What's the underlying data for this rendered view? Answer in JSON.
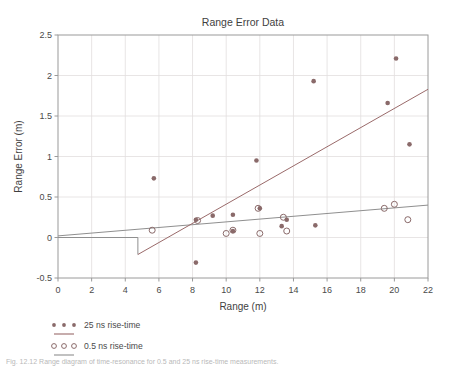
{
  "figure": {
    "caption": "Fig. 12.12  Range diagram of time-resonance for 0.5 and 25 ns rise-time measurements."
  },
  "chart_data": {
    "type": "scatter",
    "title": "Range Error Data",
    "xlabel": "Range (m)",
    "ylabel": "Range Error (m)",
    "xlim": [
      0,
      22
    ],
    "ylim": [
      -0.5,
      2.5
    ],
    "xticks": [
      0,
      2,
      4,
      6,
      8,
      10,
      12,
      14,
      16,
      18,
      20,
      22
    ],
    "yticks": [
      -0.5,
      0,
      0.5,
      1,
      1.5,
      2,
      2.5
    ],
    "xtick_labels": [
      "0",
      "2",
      "4",
      "6",
      "8",
      "10",
      "12",
      "14",
      "16",
      "18",
      "20",
      "22"
    ],
    "ytick_labels": [
      "-0.5",
      "0",
      "0.5",
      "1",
      "1.5",
      "2",
      "2.5"
    ],
    "grid": true,
    "legend_position": "below-left",
    "marker_color": "#8a6a6a",
    "line_color_25ns": "#9a6a6a",
    "line_color_05ns": "#8f8f8f",
    "axis_color": "#9a9a9a",
    "grid_color": "#e2dede",
    "series": [
      {
        "name": "25 ns rise-time",
        "marker": "filled-circle",
        "points": [
          [
            5.7,
            0.73
          ],
          [
            8.2,
            0.22
          ],
          [
            8.2,
            -0.31
          ],
          [
            9.2,
            0.27
          ],
          [
            10.4,
            0.28
          ],
          [
            10.4,
            0.08
          ],
          [
            11.8,
            0.95
          ],
          [
            12.0,
            0.36
          ],
          [
            13.3,
            0.14
          ],
          [
            13.6,
            0.22
          ],
          [
            15.2,
            1.93
          ],
          [
            15.3,
            0.15
          ],
          [
            19.6,
            1.66
          ],
          [
            20.1,
            2.21
          ],
          [
            20.9,
            1.15
          ]
        ],
        "fit_line": {
          "x": [
            4.75,
            22.0
          ],
          "y": [
            -0.21,
            1.83
          ]
        }
      },
      {
        "name": "0.5 ns rise-time",
        "marker": "open-circle",
        "points": [
          [
            5.6,
            0.09
          ],
          [
            8.3,
            0.21
          ],
          [
            10.0,
            0.05
          ],
          [
            10.4,
            0.09
          ],
          [
            11.9,
            0.36
          ],
          [
            12.0,
            0.05
          ],
          [
            13.4,
            0.25
          ],
          [
            13.6,
            0.08
          ],
          [
            19.4,
            0.36
          ],
          [
            20.0,
            0.41
          ],
          [
            20.8,
            0.22
          ]
        ],
        "fit_line": {
          "x": [
            0.0,
            22.0
          ],
          "y": [
            0.02,
            0.4
          ]
        },
        "zero_segment": {
          "x": [
            0.0,
            4.75
          ],
          "y": 0.0
        },
        "drop_segment": {
          "x": 4.75,
          "y": [
            0.0,
            -0.21
          ]
        }
      }
    ]
  },
  "legend": {
    "entries": [
      {
        "label": "25 ns rise-time",
        "marker": "filled-circle",
        "swatch": "line"
      },
      {
        "label": "0.5 ns rise-time",
        "marker": "open-circle",
        "swatch": "line"
      }
    ]
  }
}
